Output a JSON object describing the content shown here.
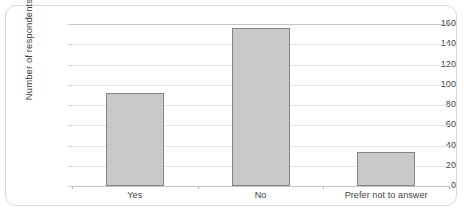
{
  "chart_data": {
    "type": "bar",
    "title": "",
    "xlabel": "",
    "ylabel": "Number of respondents",
    "categories": [
      "Yes",
      "No",
      "Prefer not to answer"
    ],
    "values": [
      92,
      156,
      34
    ],
    "ylim": [
      0,
      160
    ],
    "yticks": [
      0,
      20,
      40,
      60,
      80,
      100,
      120,
      140,
      160
    ],
    "ytick_labels": [
      "0",
      "20",
      "40",
      "60",
      "80",
      "100",
      "120",
      "140",
      "160"
    ],
    "grid": "horizontal",
    "legend": "none",
    "bar_fill_color": "#C9C9C9",
    "bar_border_color": "#848484",
    "gridline_color": "#E4E4E4",
    "axis_line_color": "#C4C4C4",
    "text_color": "#3F3F3F",
    "frame_border_color": "#D9D9D9",
    "background_color": "#FFFFFF"
  }
}
